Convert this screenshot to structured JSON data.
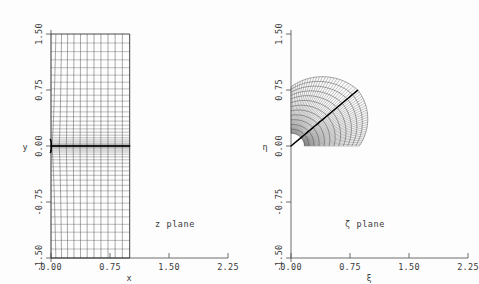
{
  "figure": {
    "background_color": "#fdfdfd",
    "line_color": "#1d1d1d",
    "accent_color": "#000000",
    "panel_count": 2
  },
  "chart_data": [
    {
      "type": "line",
      "id": "z-plane-mesh",
      "title": "z plane",
      "xlabel": "x",
      "ylabel": "y",
      "xticks": [
        "0.00",
        "0.75",
        "1.50",
        "2.25"
      ],
      "xtick_values": [
        0.0,
        0.75,
        1.5,
        2.25
      ],
      "yticks": [
        "1.50",
        "0.75",
        "0.00",
        "-0.75",
        "-1.50"
      ],
      "ytick_values": [
        1.5,
        0.75,
        0.0,
        -0.75,
        -1.5
      ],
      "xlim": [
        0.0,
        2.45
      ],
      "ylim": [
        -1.62,
        1.62
      ],
      "grid": false,
      "legend": "none",
      "description": "Computational grid in the physical z plane: a rectangular curvilinear mesh spanning x from 0 to about 1.0 and y from -1.5 to 1.5, clustered toward a horizontal flat plate lying along y = 0.",
      "mesh": {
        "x_range": [
          0.0,
          1.0
        ],
        "y_range": [
          -1.5,
          1.5
        ],
        "n_xlines": 13,
        "n_ylines": 41,
        "clustering": "geometric toward y=0",
        "feature": "flat-plate branch cut along y=0 from leading edge at x=0"
      },
      "annotations": [
        {
          "text": "z plane",
          "x": 1.55,
          "y": -1.08
        }
      ]
    },
    {
      "type": "line",
      "id": "zeta-plane-mesh",
      "title": "ζ plane",
      "xlabel": "ξ",
      "ylabel": "η",
      "xticks": [
        "0.00",
        "0.75",
        "1.50",
        "2.25"
      ],
      "xtick_values": [
        0.0,
        0.75,
        1.5,
        2.25
      ],
      "yticks": [
        "1.50",
        "0.75",
        "0.00",
        "-0.75",
        "-1.50"
      ],
      "ytick_values": [
        1.5,
        0.75,
        0.0,
        -0.75,
        -1.5
      ],
      "xlim": [
        0.0,
        2.45
      ],
      "ylim": [
        -1.62,
        1.62
      ],
      "grid": false,
      "legend": "none",
      "description": "The same grid mapped into the transformed ζ plane: a curvilinear quarter-sector mesh occupying the first quadrant, bounded by the η axis on the left and the ξ axis below, with a heavy diagonal cut running from the origin outward at roughly 45 degrees.",
      "mesh": {
        "radial_range": [
          0.18,
          1.18
        ],
        "angular_range_deg": [
          0,
          90
        ],
        "n_radial_lines": 41,
        "n_angular_lines": 13,
        "feature": "image of the plate is the diagonal ray from origin"
      },
      "annotations": [
        {
          "text": "ζ plane",
          "x": 1.0,
          "y": -1.08
        }
      ]
    }
  ]
}
